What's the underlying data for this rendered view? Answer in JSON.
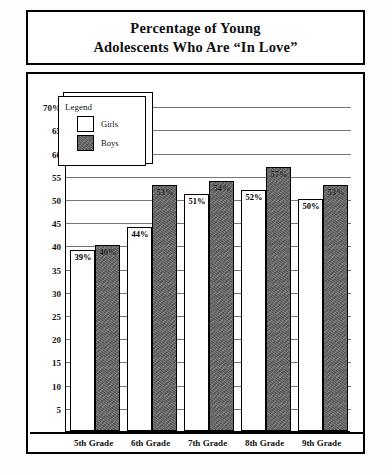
{
  "title": {
    "line1": "Percentage of Young",
    "line2": "Adolescents Who Are “In Love”"
  },
  "legend": {
    "heading": "Legend",
    "entries": [
      {
        "label": "Girls",
        "swatch": "white-square-swatch",
        "color": "#ffffff"
      },
      {
        "label": "Boys",
        "swatch": "shaded-square-swatch",
        "color": "#6b6b6b"
      }
    ]
  },
  "chart_data": {
    "type": "bar",
    "title": "Percentage of Young Adolescents Who Are “In Love”",
    "xlabel": "",
    "ylabel": "",
    "categories": [
      "5th Grade",
      "6th Grade",
      "7th Grade",
      "8th Grade",
      "9th Grade"
    ],
    "series": [
      {
        "name": "Girls",
        "values": [
          39,
          44,
          51,
          52,
          50
        ],
        "labels": [
          "39%",
          "44%",
          "51%",
          "52%",
          "50%"
        ]
      },
      {
        "name": "Boys",
        "values": [
          40,
          53,
          54,
          57,
          53
        ],
        "labels": [
          "40%",
          "53%",
          "54%",
          "57%",
          "53%"
        ]
      }
    ],
    "ylim": [
      0,
      72
    ],
    "yticks": [
      70,
      65,
      60,
      55,
      50,
      45,
      40,
      35,
      30,
      25,
      20,
      15,
      10,
      5
    ],
    "ytick_labels": [
      "70%",
      "65",
      "60",
      "55",
      "50",
      "45",
      "40",
      "35",
      "30",
      "25",
      "20",
      "15",
      "10",
      "5"
    ],
    "grid": true,
    "legend_position": "upper-left-inset"
  }
}
